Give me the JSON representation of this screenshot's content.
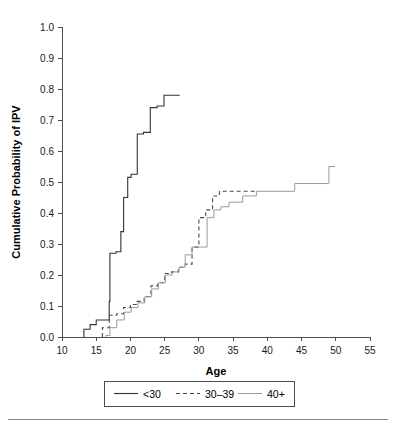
{
  "chart_data": {
    "type": "line",
    "subtype": "step-post cumulative incidence (Kaplan-Meier style)",
    "title": "",
    "xlabel": "Age",
    "ylabel": "Cumulative Probability of IPV",
    "xlim": [
      10,
      55
    ],
    "ylim": [
      0.0,
      1.0
    ],
    "xticks": [
      10,
      15,
      20,
      25,
      30,
      35,
      40,
      45,
      50,
      55
    ],
    "xtick_labels": [
      "10",
      "15",
      "20",
      "25",
      "30",
      "35",
      "40",
      "45",
      "50",
      "55"
    ],
    "yticks": [
      0.0,
      0.1,
      0.2,
      0.3,
      0.4,
      0.5,
      0.6,
      0.7,
      0.8,
      0.9,
      1.0
    ],
    "ytick_labels": [
      "0.0",
      "0.1",
      "0.2",
      "0.3",
      "0.4",
      "0.5",
      "0.6",
      "0.7",
      "0.8",
      "0.9",
      "1.0"
    ],
    "grid": false,
    "legend_position": "bottom-outside",
    "series": [
      {
        "name": "<30",
        "color": "#333333",
        "dash": "none",
        "width": 1.1,
        "x": [
          13.2,
          13.2,
          14.1,
          15.0,
          16.1,
          16.9,
          17.0,
          17.9,
          18.6,
          19.0,
          19.6,
          20.1,
          21.0,
          21.9,
          22.9,
          23.9,
          24.9,
          25.8,
          27.2
        ],
        "y": [
          0.0,
          0.025,
          0.04,
          0.055,
          0.055,
          0.115,
          0.27,
          0.275,
          0.34,
          0.45,
          0.515,
          0.525,
          0.655,
          0.66,
          0.74,
          0.745,
          0.78,
          0.78,
          0.78
        ]
      },
      {
        "name": "30–39",
        "color": "#4a4a4a",
        "dash": "4,3",
        "width": 1.1,
        "x": [
          15.9,
          15.9,
          16.9,
          18.0,
          19.0,
          20.0,
          21.0,
          22.0,
          23.0,
          24.0,
          25.0,
          26.0,
          27.0,
          28.0,
          29.0,
          30.0,
          31.0,
          32.0,
          33.0,
          38.2
        ],
        "y": [
          0.0,
          0.03,
          0.07,
          0.075,
          0.095,
          0.105,
          0.115,
          0.13,
          0.165,
          0.175,
          0.205,
          0.21,
          0.225,
          0.235,
          0.29,
          0.385,
          0.41,
          0.455,
          0.47,
          0.47
        ]
      },
      {
        "name": "40+",
        "color": "#9a9a9a",
        "dash": "none",
        "width": 1.0,
        "x": [
          16.4,
          16.4,
          17.0,
          18.0,
          19.1,
          20.1,
          21.1,
          22.1,
          23.1,
          24.1,
          25.1,
          26.1,
          27.1,
          28.0,
          29.0,
          30.2,
          31.2,
          32.2,
          33.2,
          34.4,
          36.4,
          38.4,
          40.4,
          44.0,
          49.0,
          49.0,
          49.9
        ],
        "y": [
          0.0,
          0.005,
          0.03,
          0.055,
          0.08,
          0.095,
          0.11,
          0.13,
          0.155,
          0.175,
          0.2,
          0.21,
          0.225,
          0.265,
          0.29,
          0.29,
          0.385,
          0.41,
          0.42,
          0.435,
          0.455,
          0.47,
          0.47,
          0.495,
          0.495,
          0.55,
          0.55
        ]
      }
    ]
  },
  "legend": {
    "entries": [
      {
        "label": "<30",
        "style": "solid",
        "color": "#333333"
      },
      {
        "label": "30–39",
        "style": "dashed",
        "color": "#4a4a4a"
      },
      {
        "label": "40+",
        "style": "solid",
        "color": "#9a9a9a"
      }
    ]
  }
}
